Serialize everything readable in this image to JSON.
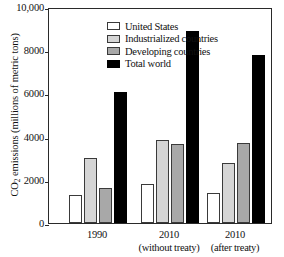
{
  "chart_data": {
    "type": "bar",
    "title": "",
    "xlabel": "",
    "ylabel": "CO2 emissions (millions of metric tons)",
    "ylabel_prefix": "CO",
    "ylabel_subscript": "2",
    "ylabel_suffix": " emissions (millions of metric tons)",
    "ylim": [
      0,
      10000
    ],
    "ytick_values": [
      0,
      2000,
      4000,
      6000,
      8000,
      10000
    ],
    "ytick_labels": [
      "0",
      "2000",
      "4000",
      "6000",
      "8000",
      "10,000"
    ],
    "grid": false,
    "legend_position": "top-left",
    "categories": [
      "1990",
      "2010",
      "2010"
    ],
    "category_sublabels": [
      "",
      "(without treaty)",
      "(after treaty)"
    ],
    "series": [
      {
        "name": "United States",
        "color": "#ffffff",
        "values": [
          1300,
          1800,
          1400
        ]
      },
      {
        "name": "Industrialized countries",
        "color": "#d5d5d5",
        "values": [
          3000,
          3850,
          2800
        ]
      },
      {
        "name": "Developing countries",
        "color": "#a8a8a8",
        "values": [
          1600,
          3650,
          3700
        ]
      },
      {
        "name": "Total world",
        "color": "#000000",
        "values": [
          6050,
          8900,
          7800
        ]
      }
    ]
  },
  "legend": {
    "items": [
      {
        "label": "United States",
        "swatch": "white-square-swatch"
      },
      {
        "label": "Industrialized countries",
        "swatch": "light-gray-square-swatch"
      },
      {
        "label": "Developing countries",
        "swatch": "medium-gray-square-swatch"
      },
      {
        "label": "Total world",
        "swatch": "black-square-swatch"
      }
    ]
  },
  "axis": {
    "y_title_part1": "CO",
    "y_title_sub": "2",
    "y_title_part2": " emissions (millions of metric tons)"
  }
}
